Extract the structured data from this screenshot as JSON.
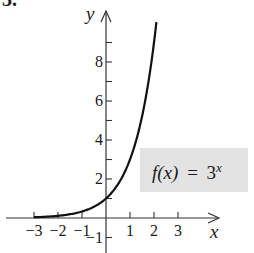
{
  "problem_number": "3.",
  "chart_data": {
    "type": "line",
    "title": "",
    "function_label": "f(x) = 3^x",
    "function_label_parts": {
      "lhs": "f(x)",
      "eq": "=",
      "base": "3",
      "exp": "x"
    },
    "xlabel": "x",
    "ylabel": "y",
    "x_ticks": [
      -3,
      -2,
      -1,
      1,
      2,
      3
    ],
    "x_tick_labels": [
      "−3",
      "−2",
      "−1",
      "1",
      "2",
      "3"
    ],
    "y_ticks": [
      -1,
      1,
      2,
      3,
      4,
      5,
      6,
      7,
      8,
      9
    ],
    "y_tick_labels": [
      {
        "value": -1,
        "label": "−1"
      },
      {
        "value": 2,
        "label": "2"
      },
      {
        "value": 4,
        "label": "4"
      },
      {
        "value": 6,
        "label": "6"
      },
      {
        "value": 8,
        "label": "8"
      }
    ],
    "xlim": [
      -4.4,
      4.6
    ],
    "ylim": [
      -1.8,
      10.5
    ],
    "grid": false,
    "series": [
      {
        "name": "f(x) = 3^x",
        "x": [
          -3,
          -2.5,
          -2,
          -1.5,
          -1,
          -0.5,
          0,
          0.5,
          1,
          1.5,
          2,
          2.1
        ],
        "y": [
          0.037,
          0.064,
          0.111,
          0.192,
          0.333,
          0.577,
          1,
          1.732,
          3,
          5.196,
          9,
          10.05
        ]
      }
    ],
    "colors": {
      "curve": "#111111",
      "axes": "#333333",
      "label_box": "#e3e3e3"
    }
  }
}
